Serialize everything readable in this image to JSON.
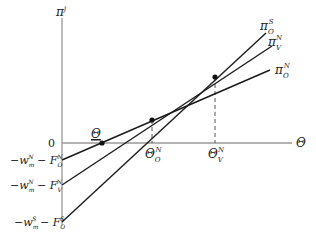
{
  "diagram": {
    "y_axis_label": "π",
    "y_axis_label_sup": "j",
    "x_axis_label": "Θ",
    "origin_label": "0",
    "lines": [
      {
        "name": "pi-O-N",
        "label": "π",
        "sub": "O",
        "sup": "N",
        "intercept_label": {
          "main": "−w",
          "main_sub": "m",
          "main_sup": "N",
          "minus": " − F",
          "f_sub": "O",
          "f_sup": "N"
        }
      },
      {
        "name": "pi-V-N",
        "label": "π",
        "sub": "V",
        "sup": "N",
        "intercept_label": {
          "main": "−w",
          "main_sub": "m",
          "main_sup": "N",
          "minus": " − F",
          "f_sub": "V",
          "f_sup": "N"
        }
      },
      {
        "name": "pi-O-S",
        "label": "π",
        "sub": "O",
        "sup": "S",
        "intercept_label": {
          "main": "−w",
          "main_sub": "m",
          "main_sup": "S",
          "minus": " − F",
          "f_sub": "O",
          "f_sup": "S"
        }
      }
    ],
    "x_points": [
      {
        "name": "theta-lower",
        "label": "Θ",
        "underline": true
      },
      {
        "name": "theta-O-N",
        "label": "Θ",
        "sub": "O",
        "sup": "N"
      },
      {
        "name": "theta-V-N",
        "label": "Θ",
        "sub": "V",
        "sup": "N"
      }
    ],
    "colors": {
      "axis": "#9a9a9a",
      "line": "#1a1a1a",
      "dash": "#555555",
      "text": "#222222"
    }
  }
}
